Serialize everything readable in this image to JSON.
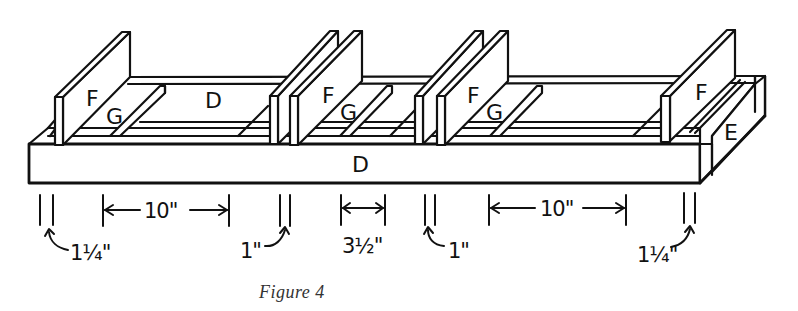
{
  "figure": {
    "caption": "Figure 4",
    "line_color": "#111111",
    "background": "#ffffff"
  },
  "parts": {
    "front_board": "D",
    "bottom_board": "D",
    "end_board": "E",
    "dividers": [
      "F",
      "F",
      "F",
      "F"
    ],
    "spacers": [
      "G",
      "G",
      "G"
    ]
  },
  "dimensions": [
    {
      "label": "1¼\"",
      "type": "thickness",
      "position": "left end"
    },
    {
      "label": "10\"",
      "type": "span",
      "position": "left compartment"
    },
    {
      "label": "1\"",
      "type": "thickness",
      "position": "middle-left pair"
    },
    {
      "label": "3½\"",
      "type": "span",
      "position": "center compartment"
    },
    {
      "label": "1\"",
      "type": "thickness",
      "position": "middle-right pair"
    },
    {
      "label": "10\"",
      "type": "span",
      "position": "right compartment"
    },
    {
      "label": "1¼\"",
      "type": "thickness",
      "position": "right end"
    }
  ]
}
